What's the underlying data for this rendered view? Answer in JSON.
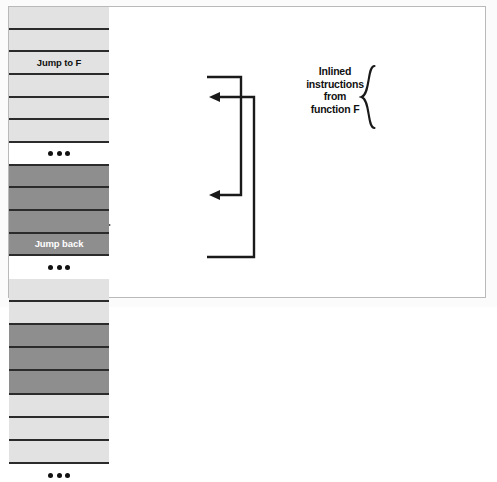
{
  "figure": {
    "colors": {
      "row_light": "#e2e2e2",
      "row_dark": "#8e8e8e",
      "row_blank": "#ffffff",
      "outline": "#2b2b2b",
      "frame_border": "#b9b9b9",
      "text": "#111111",
      "dark_row_text": "#ffffff"
    }
  },
  "left_caption": {
    "line1": "Executing",
    "line2": "instructions",
    "line3": "in order",
    "arrow_icon": "dashed-down-arrow-icon"
  },
  "left_column": {
    "name": "non-inlined-instruction-column",
    "rows": [
      {
        "label": "",
        "style": "light"
      },
      {
        "label": "",
        "style": "light"
      },
      {
        "label": "Jump to F",
        "style": "light"
      },
      {
        "label": "",
        "style": "light"
      },
      {
        "label": "",
        "style": "light"
      },
      {
        "label": "",
        "style": "light"
      },
      {
        "label": "•••",
        "style": "blank"
      },
      {
        "label": "",
        "style": "dark"
      },
      {
        "label": "",
        "style": "dark"
      },
      {
        "label": "",
        "style": "dark"
      },
      {
        "label": "Jump back",
        "style": "dark"
      },
      {
        "label": "•••",
        "style": "blank"
      }
    ]
  },
  "right_column": {
    "name": "inlined-instruction-column",
    "rows": [
      {
        "label": "",
        "style": "light"
      },
      {
        "label": "",
        "style": "light"
      },
      {
        "label": "",
        "style": "dark"
      },
      {
        "label": "",
        "style": "dark"
      },
      {
        "label": "",
        "style": "dark"
      },
      {
        "label": "",
        "style": "light"
      },
      {
        "label": "",
        "style": "light"
      },
      {
        "label": "",
        "style": "light"
      },
      {
        "label": "•••",
        "style": "blank"
      }
    ]
  },
  "function_f_annotation": {
    "label": "Function F",
    "brace_icon": "curly-brace-right-icon"
  },
  "inlined_annotation": {
    "line1": "Inlined",
    "line2": "instructions",
    "line3": "from",
    "line4": "function F",
    "brace_icon": "curly-brace-left-icon"
  },
  "jump_arrows": {
    "call_arrow_name": "jump-to-f-arrow",
    "return_arrow_name": "jump-back-arrow"
  }
}
